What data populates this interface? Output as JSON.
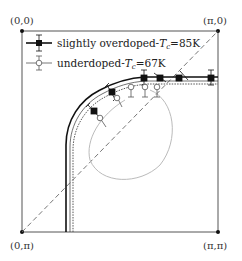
{
  "figure": {
    "type": "brillouin-zone-fermi-surface",
    "corners": {
      "top_left": "(0,0)",
      "top_right": "(π,0)",
      "bottom_left": "(0,π)",
      "bottom_right": "(π,π)"
    },
    "legend": [
      {
        "label": "slightly overdoped-",
        "tc_symbol": "T",
        "tc_sub": "c",
        "tc_value": "=85K",
        "marker": "filled-square",
        "line": "solid-thick"
      },
      {
        "label": "underdoped-",
        "tc_symbol": "T",
        "tc_sub": "c",
        "tc_value": "=67K",
        "marker": "open-circle",
        "line": "dotted"
      }
    ],
    "colors": {
      "frame": "#444444",
      "overdoped": "#111111",
      "underdoped": "#555555",
      "pocket": "#bbbbbb",
      "diagonal": "#666666"
    }
  }
}
